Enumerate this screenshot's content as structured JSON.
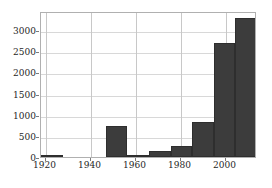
{
  "chart_data": {
    "type": "bar",
    "title": "",
    "subtitle": "",
    "xlabel": "",
    "ylabel": "",
    "grid": true,
    "legend": null,
    "xlim": [
      1918,
      2014
    ],
    "ylim": [
      0,
      3450
    ],
    "bin_width": 9.6,
    "xticks": [
      1920,
      1940,
      1960,
      1980,
      2000
    ],
    "xtick_labels": [
      "1920",
      "1940",
      "1960",
      "1980",
      "2000"
    ],
    "yticks": [
      0,
      500,
      1000,
      1500,
      2000,
      2500,
      3000
    ],
    "ytick_labels": [
      "0",
      "500",
      "1000",
      "1500",
      "2000",
      "2500",
      "3000"
    ],
    "bars": [
      {
        "bin_start": 1918,
        "bin_end": 1927.6,
        "label": "1918–1928",
        "value": 15
      },
      {
        "bin_start": 1927.6,
        "bin_end": 1937.2,
        "label": "1928–1937",
        "value": 0
      },
      {
        "bin_start": 1937.2,
        "bin_end": 1946.8,
        "label": "1937–1947",
        "value": 0
      },
      {
        "bin_start": 1946.8,
        "bin_end": 1956.4,
        "label": "1947–1956",
        "value": 730
      },
      {
        "bin_start": 1956.4,
        "bin_end": 1966.0,
        "label": "1956–1966",
        "value": 10
      },
      {
        "bin_start": 1966.0,
        "bin_end": 1975.6,
        "label": "1966–1976",
        "value": 140
      },
      {
        "bin_start": 1975.6,
        "bin_end": 1985.2,
        "label": "1976–1985",
        "value": 250
      },
      {
        "bin_start": 1985.2,
        "bin_end": 1994.8,
        "label": "1985–1995",
        "value": 830
      },
      {
        "bin_start": 1994.8,
        "bin_end": 2004.4,
        "label": "1995–2004",
        "value": 2700
      },
      {
        "bin_start": 2004.4,
        "bin_end": 2014.0,
        "label": "2004–2014",
        "value": 3280
      }
    ],
    "categories": [
      "1918–1928",
      "1928–1937",
      "1937–1947",
      "1947–1956",
      "1956–1966",
      "1966–1976",
      "1976–1985",
      "1985–1995",
      "1995–2004",
      "2004–2014"
    ],
    "values": [
      15,
      0,
      0,
      730,
      10,
      140,
      250,
      830,
      2700,
      3280
    ],
    "colors": {
      "bar_fill": "#3c3c3c",
      "bar_edge": "#2e2e2e",
      "grid": "#d8d8d8",
      "axis": "#b0b0b0",
      "text": "#262626",
      "background": "#ffffff"
    }
  }
}
